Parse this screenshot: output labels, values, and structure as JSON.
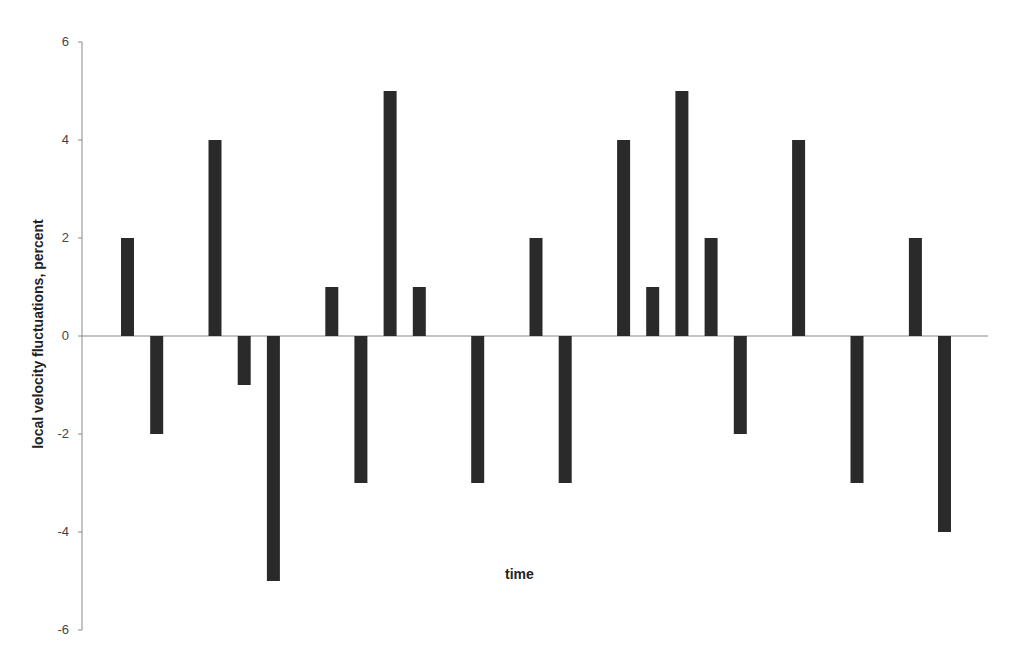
{
  "chart_data": {
    "type": "bar",
    "title": "",
    "xlabel": "time",
    "ylabel": "local velocity fluctuations, percent",
    "ylim": [
      -6,
      6
    ],
    "yticks": [
      6,
      4,
      2,
      0,
      -2,
      -4,
      -6
    ],
    "ytick_labels": [
      "6",
      "4",
      "2",
      "0",
      "-2",
      "-4",
      "-6"
    ],
    "grid": false,
    "legend": null,
    "bar_color": "#2a2a2a",
    "categories": [
      "1",
      "2",
      "3",
      "4",
      "5",
      "6",
      "7",
      "8",
      "9",
      "10",
      "11",
      "12",
      "13",
      "14",
      "15",
      "16",
      "17",
      "18",
      "19",
      "20",
      "21",
      "22",
      "23",
      "24",
      "25",
      "26",
      "27",
      "28",
      "29"
    ],
    "values": [
      2,
      -2,
      0,
      4,
      -1,
      -5,
      0,
      1,
      -3,
      5,
      1,
      0,
      -3,
      0,
      2,
      -3,
      0,
      4,
      1,
      5,
      2,
      -2,
      0,
      4,
      0,
      -3,
      0,
      2,
      -4
    ]
  }
}
